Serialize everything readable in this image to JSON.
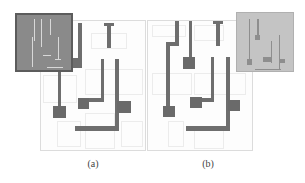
{
  "figure": {
    "panels": [
      {
        "id": "a",
        "caption": "(a)",
        "description": "layout with dark micrograph inset top-left"
      },
      {
        "id": "b",
        "caption": "(b)",
        "description": "layout with light micrograph inset top-right"
      }
    ],
    "colors": {
      "wire": "#6e6e6e",
      "grid": "#ececec",
      "inset_a": "#8a8a8a",
      "inset_b": "#c4c4c4",
      "background": "#ffffff"
    }
  }
}
